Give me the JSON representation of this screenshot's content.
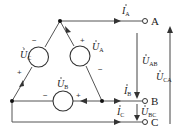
{
  "diagram": {
    "type": "three-phase delta-connected voltage source circuit",
    "colors": {
      "wire": "#444444",
      "text": "#222222",
      "background": "#ffffff"
    },
    "sources": [
      {
        "id": "UA",
        "label": "U",
        "sub": "A",
        "plus": "+",
        "minus": "−"
      },
      {
        "id": "UB",
        "label": "U",
        "sub": "B",
        "plus": "+",
        "minus": "−"
      },
      {
        "id": "UC",
        "label": "U",
        "sub": "C",
        "plus": "+",
        "minus": "−"
      }
    ],
    "currents": [
      {
        "id": "IA",
        "label": "I",
        "sub": "A"
      },
      {
        "id": "IB",
        "label": "I",
        "sub": "B"
      },
      {
        "id": "IC",
        "label": "I",
        "sub": "C"
      }
    ],
    "line_voltages": [
      {
        "id": "UAB",
        "label": "U",
        "sub": "AB"
      },
      {
        "id": "UBC",
        "label": "U",
        "sub": "BC"
      },
      {
        "id": "UCA",
        "label": "U",
        "sub": "CA"
      }
    ],
    "terminals": [
      "A",
      "B",
      "C"
    ],
    "dot": "·"
  }
}
